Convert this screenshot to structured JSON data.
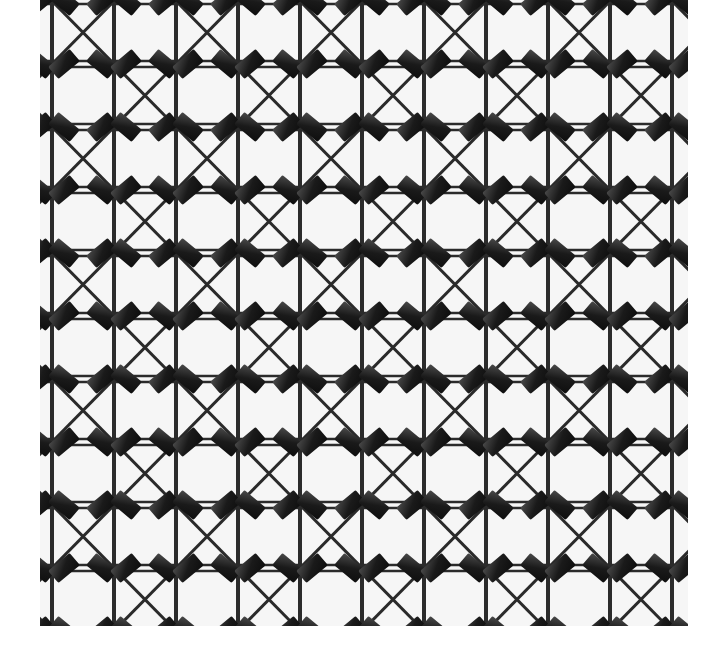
{
  "image": {
    "subject": "wire mesh lattice with diagonal cross bracing and rectangular clips at intersections",
    "style": "black-and-white photograph",
    "colors": {
      "background": "#ffffff",
      "paper": "#f4f4f4",
      "wire": "#2a2a2a",
      "clip": "#1a1a1a",
      "clip_highlight": "#4a4a4a"
    },
    "grid": {
      "cell_width": 62,
      "cell_height": 63,
      "columns": 11,
      "rows": 10
    }
  }
}
